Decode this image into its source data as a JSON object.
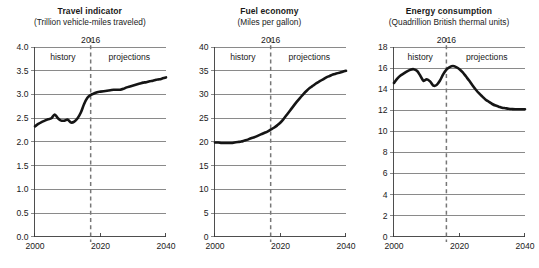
{
  "figure": {
    "background": "#ffffff",
    "line_color": "#151515",
    "grid_color": "#6d6d6d",
    "divider_color": "#777777"
  },
  "chart_data": [
    {
      "type": "line",
      "title": "Travel indicator",
      "subtitle": "(Trillion vehicle-miles traveled)",
      "xlabel": "",
      "ylabel": "",
      "xlim": [
        2000,
        2040
      ],
      "ylim": [
        0.0,
        4.0
      ],
      "xticks": [
        2000,
        2020,
        2040
      ],
      "xtick_labels": [
        "2000",
        "2020",
        "2040"
      ],
      "yticks": [
        0.0,
        0.5,
        1.0,
        1.5,
        2.0,
        2.5,
        3.0,
        3.5,
        4.0
      ],
      "ytick_labels": [
        "0.0",
        "0.5",
        "1.0",
        "1.5",
        "2.0",
        "2.5",
        "3.0",
        "3.5",
        "4.0"
      ],
      "grid": true,
      "legend": "none",
      "annotations": {
        "marker_year": "2016",
        "marker_x": 2017,
        "history_label": "history",
        "projections_label": "projections"
      },
      "series": [
        {
          "name": "Travel indicator",
          "x": [
            2000,
            2001,
            2002,
            2003,
            2004,
            2005,
            2006,
            2007,
            2008,
            2009,
            2010,
            2011,
            2012,
            2013,
            2014,
            2015,
            2016,
            2017,
            2018,
            2019,
            2020,
            2021,
            2022,
            2023,
            2024,
            2025,
            2026,
            2027,
            2028,
            2029,
            2030,
            2031,
            2032,
            2033,
            2034,
            2035,
            2036,
            2037,
            2038,
            2039,
            2040
          ],
          "values": [
            2.33,
            2.38,
            2.42,
            2.45,
            2.48,
            2.5,
            2.58,
            2.5,
            2.45,
            2.45,
            2.47,
            2.41,
            2.43,
            2.5,
            2.62,
            2.8,
            2.93,
            2.99,
            3.02,
            3.05,
            3.06,
            3.07,
            3.08,
            3.09,
            3.1,
            3.1,
            3.1,
            3.12,
            3.15,
            3.17,
            3.19,
            3.21,
            3.23,
            3.25,
            3.26,
            3.28,
            3.29,
            3.31,
            3.32,
            3.34,
            3.36
          ]
        }
      ]
    },
    {
      "type": "line",
      "title": "Fuel economy",
      "subtitle": "(Miles per gallon)",
      "xlabel": "",
      "ylabel": "",
      "xlim": [
        2000,
        2040
      ],
      "ylim": [
        0,
        40
      ],
      "xticks": [
        2000,
        2020,
        2040
      ],
      "xtick_labels": [
        "2000",
        "2020",
        "2040"
      ],
      "yticks": [
        0,
        5,
        10,
        15,
        20,
        25,
        30,
        35,
        40
      ],
      "ytick_labels": [
        "0",
        "5",
        "10",
        "15",
        "20",
        "25",
        "30",
        "35",
        "40"
      ],
      "grid": true,
      "legend": "none",
      "annotations": {
        "marker_year": "2016",
        "marker_x": 2017,
        "history_label": "history",
        "projections_label": "projections"
      },
      "series": [
        {
          "name": "Fuel economy",
          "x": [
            2000,
            2001,
            2002,
            2003,
            2004,
            2005,
            2006,
            2007,
            2008,
            2009,
            2010,
            2011,
            2012,
            2013,
            2014,
            2015,
            2016,
            2017,
            2018,
            2019,
            2020,
            2021,
            2022,
            2023,
            2024,
            2025,
            2026,
            2027,
            2028,
            2029,
            2030,
            2031,
            2032,
            2033,
            2034,
            2035,
            2036,
            2037,
            2038,
            2039,
            2040
          ],
          "values": [
            19.9,
            19.9,
            19.8,
            19.8,
            19.8,
            19.8,
            19.9,
            20.0,
            20.1,
            20.3,
            20.5,
            20.8,
            21.0,
            21.3,
            21.6,
            21.9,
            22.2,
            22.6,
            23.0,
            23.5,
            24.1,
            24.9,
            25.8,
            26.7,
            27.6,
            28.5,
            29.3,
            30.1,
            30.8,
            31.4,
            31.9,
            32.4,
            32.8,
            33.2,
            33.6,
            33.9,
            34.2,
            34.4,
            34.6,
            34.8,
            35.0
          ]
        }
      ]
    },
    {
      "type": "line",
      "title": "Energy consumption",
      "subtitle": "(Quadrillion British thermal units)",
      "xlabel": "",
      "ylabel": "",
      "xlim": [
        2000,
        2040
      ],
      "ylim": [
        0,
        18
      ],
      "xticks": [
        2000,
        2020,
        2040
      ],
      "xtick_labels": [
        "2000",
        "2020",
        "2040"
      ],
      "yticks": [
        0,
        2,
        4,
        6,
        8,
        10,
        12,
        14,
        16,
        18
      ],
      "ytick_labels": [
        "0",
        "2",
        "4",
        "6",
        "8",
        "10",
        "12",
        "14",
        "16",
        "18"
      ],
      "grid": true,
      "legend": "none",
      "annotations": {
        "marker_year": "2016",
        "marker_x": 2016,
        "history_label": "history",
        "projections_label": "projections"
      },
      "series": [
        {
          "name": "Energy consumption",
          "x": [
            2000,
            2001,
            2002,
            2003,
            2004,
            2005,
            2006,
            2007,
            2008,
            2009,
            2010,
            2011,
            2012,
            2013,
            2014,
            2015,
            2016,
            2017,
            2018,
            2019,
            2020,
            2021,
            2022,
            2023,
            2024,
            2025,
            2026,
            2027,
            2028,
            2029,
            2030,
            2031,
            2032,
            2033,
            2034,
            2035,
            2036,
            2037,
            2038,
            2039,
            2040
          ],
          "values": [
            14.6,
            15.0,
            15.3,
            15.5,
            15.7,
            15.85,
            15.9,
            15.75,
            15.3,
            14.8,
            14.95,
            14.75,
            14.35,
            14.4,
            14.8,
            15.4,
            15.85,
            16.1,
            16.2,
            16.1,
            15.9,
            15.6,
            15.2,
            14.8,
            14.35,
            13.95,
            13.6,
            13.3,
            13.0,
            12.8,
            12.6,
            12.45,
            12.35,
            12.25,
            12.2,
            12.15,
            12.12,
            12.1,
            12.1,
            12.1,
            12.1
          ]
        }
      ]
    }
  ]
}
